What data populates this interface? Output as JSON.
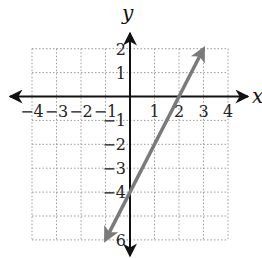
{
  "chart_data": {
    "type": "line",
    "title": "",
    "xlabel": "x",
    "ylabel": "y",
    "xlim": [
      -4,
      4
    ],
    "ylim": [
      -6,
      2
    ],
    "grid": true,
    "grid_style": "dotted",
    "x_ticks": [
      -4,
      -3,
      -2,
      -1,
      1,
      2,
      3,
      4
    ],
    "y_ticks": [
      2,
      1,
      -1,
      -2,
      -3,
      -4,
      -6
    ],
    "x_tick_labels": [
      "−4",
      "−3",
      "−2",
      "−1",
      "1",
      "2",
      "3",
      "4"
    ],
    "y_tick_labels": [
      "2",
      "1",
      "−1",
      "−2",
      "−3",
      "−4",
      "6"
    ],
    "series": [
      {
        "name": "y = 2x − 4",
        "equation": "y = 2x - 4",
        "color": "#7a7a7a",
        "arrows": "both",
        "points": [
          [
            -1,
            -6
          ],
          [
            0,
            -4
          ],
          [
            2,
            0
          ],
          [
            3,
            2
          ]
        ]
      }
    ],
    "legend": null
  },
  "labels": {
    "x_axis": "x",
    "y_axis": "y"
  },
  "colors": {
    "axis": "#111111",
    "grid": "#9a9a9a",
    "line": "#7a7a7a"
  }
}
